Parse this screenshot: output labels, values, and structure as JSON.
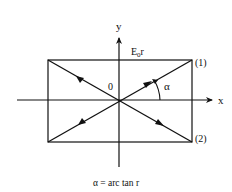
{
  "diagram": {
    "axes": {
      "x_label": "x",
      "y_label": "y",
      "origin_label": "0"
    },
    "top_label": {
      "main": "E",
      "sub": "0",
      "tail": "r"
    },
    "corner_labels": {
      "upper_right": "(1)",
      "lower_right": "(2)"
    },
    "angle_label": "α",
    "caption": "α = arc tan r",
    "colors": {
      "ink": "#111111",
      "background": "#ffffff"
    }
  }
}
